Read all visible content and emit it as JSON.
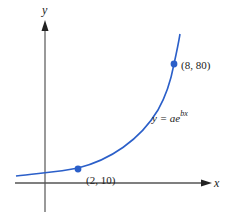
{
  "diagram": {
    "axes": {
      "x_label": "x",
      "y_label": "y"
    },
    "curve": {
      "equation_prefix": "y = ae",
      "equation_exponent": "bx",
      "color": "#2b5fc9"
    },
    "points": [
      {
        "label": "(2, 10)",
        "x": 2,
        "y": 10
      },
      {
        "label": "(8, 80)",
        "x": 8,
        "y": 80
      }
    ],
    "axis_color": "#555555",
    "point_color": "#2b5fc9"
  }
}
